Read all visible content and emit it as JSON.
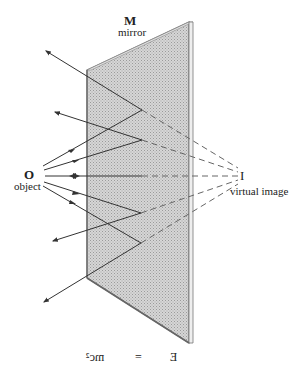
{
  "labels": {
    "mirror_letter": "M",
    "mirror_word": "mirror",
    "object_letter": "O",
    "object_word": "object",
    "image_letter": "I",
    "image_word": "virtual image"
  },
  "reflection_text": {
    "left": "mc²",
    "middle": "=",
    "right": "E",
    "note": "E = mc² rendered horizontally mirrored"
  },
  "colors": {
    "mirror_fill": "#cfcfcf",
    "mirror_edge": "#777777",
    "ray": "#333333",
    "virtual_ray": "#666666",
    "text": "#222222"
  }
}
